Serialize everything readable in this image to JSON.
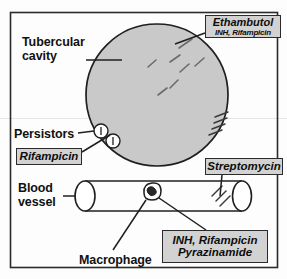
{
  "figure": {
    "background_color": "#fdfdfd",
    "frame_color": "#2b2b2b",
    "cavity_fill": "#c9c9c9",
    "box_fill": "#d2d2d2",
    "ink_color": "#111111"
  },
  "labels": {
    "tubercular_cavity": "Tubercular\ncavity",
    "tubercular_cavity_line1": "Tubercular",
    "tubercular_cavity_line2": "cavity",
    "persistors": "Persistors",
    "blood_vessel_line1": "Blood",
    "blood_vessel_line2": "vessel",
    "macrophage": "Macrophage"
  },
  "drug_boxes": {
    "ethambutol": {
      "name": "ethambutol-box",
      "main": "Ethambutol",
      "sub": "INH, Rifampicin",
      "points_to": "tubercular-cavity"
    },
    "rifampicin": {
      "name": "rifampicin-box",
      "main": "Rifampicin",
      "points_to": "persistors"
    },
    "streptomycin": {
      "name": "streptomycin-box",
      "main": "Streptomycin",
      "points_to": "blood-vessel-bacilli"
    },
    "inh_pyrazinamide": {
      "name": "inh-pyrazinamide-box",
      "line1": "INH, Rifampicin",
      "line2": "Pyrazinamide",
      "points_to": "macrophage"
    }
  },
  "anatomy": {
    "cavity": {
      "label": "tubercular cavity",
      "cx": 157,
      "cy": 95,
      "r": 71
    },
    "blood_vessel": {
      "label": "blood vessel",
      "x1": 76,
      "x2": 250,
      "top": 181,
      "bottom": 211
    },
    "macrophage": {
      "label": "macrophage",
      "cx": 152,
      "cy": 193,
      "r": 9
    },
    "persistor_cells": [
      {
        "cx": 101,
        "cy": 131,
        "r": 7
      },
      {
        "cx": 113,
        "cy": 141,
        "r": 7
      }
    ],
    "bacilli_in_cavity": 7,
    "bacilli_on_cavity_edge": 4,
    "bacilli_in_vessel": 3
  }
}
